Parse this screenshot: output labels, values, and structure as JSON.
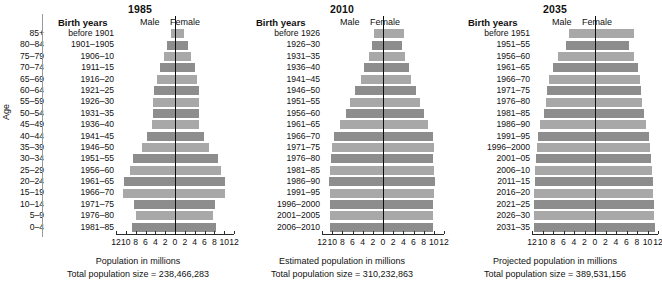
{
  "figure": {
    "age_axis_label": "Age",
    "age_groups": [
      "85+",
      "80–84",
      "75–79",
      "70–74",
      "65–69",
      "60–64",
      "55–59",
      "50–54",
      "45–49",
      "40–44",
      "35–39",
      "30–34",
      "25–29",
      "20–24",
      "15–19",
      "10–14",
      "5–9",
      "0–4"
    ],
    "header": {
      "birth_years": "Birth years",
      "male": "Male",
      "female": "Female"
    },
    "axis": {
      "ticks": [
        "12",
        "10",
        "8",
        "6",
        "4",
        "2",
        "0",
        "2",
        "4",
        "6",
        "8",
        "10",
        "12"
      ],
      "tick_values": [
        -12,
        -10,
        -8,
        -6,
        -4,
        -2,
        0,
        2,
        4,
        6,
        8,
        10,
        12
      ],
      "min": -12,
      "max": 12
    },
    "colors": {
      "bar_light": "#a8a8a8",
      "bar_dark": "#8d8d8d",
      "centerline": "#0d0d0d",
      "text": "#111111",
      "background": "#ffffff"
    }
  },
  "chart_data": {
    "type": "bar",
    "xlabel": "Population in millions",
    "ylabel": "Age",
    "xlim": [
      -12,
      12
    ],
    "grid": false,
    "legend": [
      "Male",
      "Female"
    ],
    "categories": [
      "85+",
      "80–84",
      "75–79",
      "70–74",
      "65–69",
      "60–64",
      "55–59",
      "50–54",
      "45–49",
      "40–44",
      "35–39",
      "30–34",
      "25–29",
      "20–24",
      "15–19",
      "10–14",
      "5–9",
      "0–4"
    ],
    "panels": [
      {
        "year": "1985",
        "x_caption": "Population in millions",
        "total_caption": "Total population size = 238,466,283",
        "total_population": "238,466,283",
        "birth_years": [
          "before 1901",
          "1901–1905",
          "1906–10",
          "1911–15",
          "1916–20",
          "1921–25",
          "1926–30",
          "1931–35",
          "1936–40",
          "1941–45",
          "1946–50",
          "1951–55",
          "1956–60",
          "1961–65",
          "1966–70",
          "1971–75",
          "1976–80",
          "1981–85"
        ],
        "series": [
          {
            "name": "Male",
            "values": [
              0.9,
              1.6,
              2.2,
              3.0,
              3.6,
              4.2,
              4.4,
              4.5,
              4.6,
              5.6,
              6.8,
              8.6,
              9.2,
              10.4,
              10.5,
              8.4,
              8.0,
              8.8
            ]
          },
          {
            "name": "Female",
            "values": [
              1.9,
              2.6,
              3.3,
              4.0,
              4.4,
              4.8,
              4.9,
              4.8,
              4.8,
              5.8,
              7.0,
              8.7,
              9.3,
              10.2,
              10.2,
              8.1,
              7.7,
              8.4
            ]
          }
        ]
      },
      {
        "year": "2010",
        "x_caption": "Estimated population in millions",
        "total_caption": "Total population size = 310,232,863",
        "total_population": "310,232,863",
        "birth_years": [
          "before 1926",
          "1926–30",
          "1931–35",
          "1936–40",
          "1941–45",
          "1946–50",
          "1951–55",
          "1956–60",
          "1961–65",
          "1966–70",
          "1971–75",
          "1976–80",
          "1981–85",
          "1986–90",
          "1991–95",
          "1996–2000",
          "2001–2005",
          "2006–2010"
        ],
        "series": [
          {
            "name": "Male",
            "values": [
              1.8,
              2.1,
              2.8,
              3.8,
              4.4,
              5.5,
              6.5,
              7.3,
              8.4,
              9.7,
              10.1,
              10.2,
              10.5,
              10.7,
              10.5,
              10.4,
              10.4,
              10.4
            ]
          },
          {
            "name": "Female",
            "values": [
              4.1,
              3.8,
              4.3,
              5.1,
              5.5,
              6.4,
              7.3,
              8.0,
              8.8,
              9.9,
              10.0,
              9.9,
              10.1,
              10.2,
              10.0,
              9.9,
              9.9,
              9.9
            ]
          }
        ]
      },
      {
        "year": "2035",
        "x_caption": "Projected population in millions",
        "total_caption": "Total population size = 389,531,156",
        "total_population": "389,531,156",
        "birth_years": [
          "before 1951",
          "1951–55",
          "1956–60",
          "1961–65",
          "1966–70",
          "1971–75",
          "1976–80",
          "1981–85",
          "1986–90",
          "1991–95",
          "1996–2000",
          "2001–05",
          "2006–10",
          "2011–15",
          "2016–20",
          "2021–25",
          "2026–30",
          "2031–35"
        ],
        "series": [
          {
            "name": "Male",
            "values": [
              5.0,
              5.6,
              7.0,
              8.0,
              8.8,
              9.2,
              9.4,
              9.8,
              10.4,
              10.8,
              11.0,
              11.2,
              11.4,
              11.5,
              11.6,
              11.6,
              11.7,
              11.7
            ]
          },
          {
            "name": "Female",
            "values": [
              7.4,
              6.4,
              7.4,
              8.1,
              8.6,
              8.8,
              8.9,
              9.3,
              9.8,
              10.2,
              10.4,
              10.7,
              10.9,
              11.0,
              11.1,
              11.2,
              11.3,
              11.4
            ]
          }
        ]
      }
    ]
  }
}
